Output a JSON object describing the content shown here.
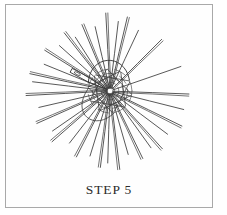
{
  "figure": {
    "caption": "STEP 5",
    "border_color": "#a9a9a9",
    "background_color": "#fefefe",
    "ink_color": "#3a3a3a",
    "alt_description": "Woven wheel / dorset button craft diagram with radiating spokes and a needle at the hub"
  },
  "illustration": {
    "type": "line-drawing",
    "subject": "woven-wheel-with-needle",
    "center": {
      "x": 104,
      "y": 86
    },
    "spoke_count": 34,
    "spoke_outer_radius_min": 60,
    "spoke_outer_radius_max": 84,
    "hub_radius": 22,
    "hub_weave_rings": 5,
    "needle": {
      "name": "threading-needle",
      "angle_degrees": 208,
      "length": 44,
      "eye_position": "outer-end"
    },
    "spokes": [
      {
        "angle": 4,
        "length": 79
      },
      {
        "angle": 15,
        "length": 76
      },
      {
        "angle": 26,
        "length": 80
      },
      {
        "angle": 36,
        "length": 72
      },
      {
        "angle": 46,
        "length": 78
      },
      {
        "angle": 56,
        "length": 70
      },
      {
        "angle": 65,
        "length": 75
      },
      {
        "angle": 74,
        "length": 66
      },
      {
        "angle": 82,
        "length": 79
      },
      {
        "angle": 90,
        "length": 72
      },
      {
        "angle": 99,
        "length": 77
      },
      {
        "angle": 108,
        "length": 68
      },
      {
        "angle": 117,
        "length": 74
      },
      {
        "angle": 127,
        "length": 66
      },
      {
        "angle": 137,
        "length": 77
      },
      {
        "angle": 147,
        "length": 70
      },
      {
        "angle": 157,
        "length": 80
      },
      {
        "angle": 167,
        "length": 73
      },
      {
        "angle": 176,
        "length": 84
      },
      {
        "angle": 185,
        "length": 78
      },
      {
        "angle": 194,
        "length": 82
      },
      {
        "angle": 203,
        "length": 71
      },
      {
        "angle": 212,
        "length": 77
      },
      {
        "angle": 221,
        "length": 68
      },
      {
        "angle": 230,
        "length": 74
      },
      {
        "angle": 239,
        "length": 64
      },
      {
        "angle": 248,
        "length": 72
      },
      {
        "angle": 257,
        "length": 66
      },
      {
        "angle": 266,
        "length": 78
      },
      {
        "angle": 275,
        "length": 70
      },
      {
        "angle": 285,
        "length": 76
      },
      {
        "angle": 296,
        "length": 67
      },
      {
        "angle": 315,
        "length": 73
      },
      {
        "angle": 340,
        "length": 75
      }
    ]
  }
}
